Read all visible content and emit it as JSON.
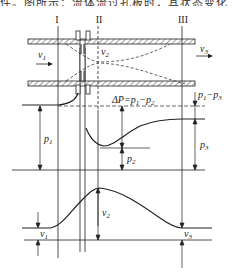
{
  "caption": "件。图所示：流体流过孔板时，其状态变化",
  "sections": {
    "s1": "I",
    "s2": "II",
    "s3": "III"
  },
  "pipe_labels": {
    "v1": "v",
    "v1_sub": "1",
    "v2": "v",
    "v2_sub": "2",
    "v3": "v",
    "v3_sub": "3"
  },
  "pressure_labels": {
    "delta_p": "ΔP=p",
    "delta_p_sub1": "1",
    "delta_p_mid": "−p",
    "delta_p_sub2": "2",
    "p1": "p",
    "p1_sub": "1",
    "p2": "p",
    "p2_sub": "2",
    "p3": "p",
    "p3_sub": "3",
    "loss": "p",
    "loss_sub1": "1",
    "loss_mid": "−p",
    "loss_sub3": "3"
  },
  "velocity_labels": {
    "v1": "v",
    "v1_sub": "1",
    "v2": "v",
    "v2_sub": "2",
    "v3": "v",
    "v3_sub": "3"
  },
  "colors": {
    "line": "#222222",
    "hatch": "#444444",
    "background": "#ffffff"
  }
}
